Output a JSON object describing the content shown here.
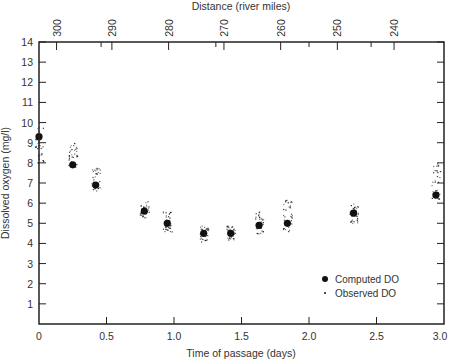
{
  "chart_data": {
    "type": "scatter",
    "title": "",
    "xlabel": "Time of passage (days)",
    "ylabel": "Dissolved oxygen (mg/l)",
    "top_xlabel": "Distance (river miles)",
    "xlim": [
      0,
      3.0
    ],
    "ylim": [
      0,
      14
    ],
    "x_ticks": [
      0,
      0.5,
      1.0,
      1.5,
      2.0,
      2.5,
      3.0
    ],
    "x_tick_labels": [
      "0",
      "0.5",
      "1.0",
      "1.5",
      "2.0",
      "2.5",
      "3.0"
    ],
    "y_ticks": [
      1,
      2,
      3,
      4,
      5,
      6,
      7,
      8,
      9,
      10,
      11,
      12,
      13,
      14
    ],
    "y_tick_labels": [
      "1",
      "2",
      "3",
      "4",
      "5",
      "6",
      "7",
      "8",
      "9",
      "10",
      "11",
      "12",
      "13",
      "14"
    ],
    "top_ticks_days": [
      0.13,
      0.54,
      0.96,
      1.37,
      1.79,
      2.21,
      2.63
    ],
    "top_tick_labels": [
      "300",
      "290",
      "280",
      "270",
      "260",
      "250",
      "240"
    ],
    "grid": false,
    "legend_position": "lower right",
    "legend": [
      {
        "label": "Computed DO",
        "marker": "large-dot"
      },
      {
        "label": "Observed DO",
        "marker": "small-dot"
      }
    ],
    "series": [
      {
        "name": "Computed DO",
        "x": [
          0.0,
          0.25,
          0.42,
          0.78,
          0.95,
          1.22,
          1.42,
          1.63,
          1.84,
          2.33,
          2.94
        ],
        "y": [
          9.3,
          7.9,
          6.9,
          5.6,
          5.0,
          4.5,
          4.5,
          4.9,
          5.0,
          5.5,
          6.4
        ]
      },
      {
        "name": "Observed DO",
        "x": [
          0.0,
          0.25,
          0.42,
          0.78,
          0.95,
          1.22,
          1.42,
          1.63,
          1.84,
          2.33,
          2.94
        ],
        "y_range": [
          [
            8.0,
            9.8
          ],
          [
            7.8,
            9.0
          ],
          [
            6.6,
            7.8
          ],
          [
            5.3,
            6.1
          ],
          [
            4.6,
            5.6
          ],
          [
            4.1,
            4.9
          ],
          [
            4.2,
            4.9
          ],
          [
            4.5,
            5.6
          ],
          [
            4.6,
            6.2
          ],
          [
            5.0,
            6.0
          ],
          [
            6.2,
            8.0
          ]
        ],
        "y_center": [
          8.8,
          8.4,
          7.1,
          5.6,
          4.9,
          4.4,
          4.5,
          5.3,
          5.4,
          5.4,
          7.0
        ]
      }
    ]
  },
  "colors": {
    "ink": "#111111",
    "axis": "#222222",
    "background": "#ffffff"
  }
}
